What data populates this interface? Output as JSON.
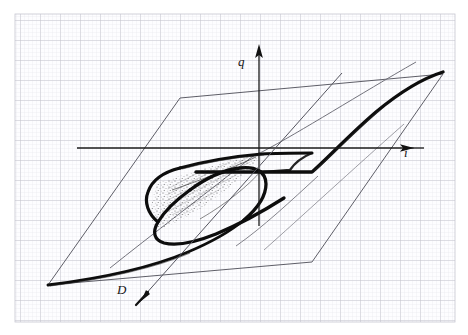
{
  "figure": {
    "medium": "pencil sketch on millimetre graph paper",
    "background_color": "#ffffff",
    "paper": {
      "x": 15,
      "y": 14,
      "width": 440,
      "height": 308,
      "fill": "#fefeff",
      "minor_grid_color": "#e3e3e8",
      "major_grid_color": "#b9b9c4",
      "minor_step": 4,
      "major_step": 20
    },
    "axes": [
      {
        "name": "vertical-axis",
        "label": "q",
        "label_position": {
          "x": 238,
          "y": 55
        },
        "from": {
          "x": 259,
          "y": 225
        },
        "to": {
          "x": 259,
          "y": 45
        },
        "arrow": "up",
        "color": "#1a1a1a"
      },
      {
        "name": "horizontal-axis",
        "label": "i",
        "label_position": {
          "x": 404,
          "y": 146
        },
        "from": {
          "x": 77,
          "y": 148
        },
        "to": {
          "x": 424,
          "y": 148
        },
        "arrow": "right",
        "color": "#1a1a1a"
      },
      {
        "name": "depth-axis",
        "label": "D",
        "label_position": {
          "x": 117,
          "y": 283
        },
        "from": {
          "x": 340,
          "y": 75
        },
        "to": {
          "x": 140,
          "y": 300
        },
        "arrow": "down-left",
        "color": "#1a1a1a"
      }
    ],
    "parallelogram": {
      "name": "base-plane-outline",
      "points": [
        {
          "x": 180,
          "y": 98
        },
        {
          "x": 443,
          "y": 74
        },
        {
          "x": 312,
          "y": 262
        },
        {
          "x": 48,
          "y": 285
        }
      ],
      "stroke": "#4a4a55",
      "stroke_width": 0.9
    },
    "curves": [
      {
        "name": "fold-surface-bold-edge",
        "description": "thick S-shaped fold edge of the catastrophe surface running from lower-left, through the double fold, up to the far right",
        "stroke": "#0d0d0d",
        "stroke_width": 3.4
      },
      {
        "name": "upper-sheet-edge",
        "description": "thin curve forming the upper sheet boundary through the cusp point",
        "stroke": "#2a2a2a",
        "stroke_width": 1.1
      },
      {
        "name": "shaded-fold-region",
        "description": "hatched / stippled shading between the two fold lines",
        "stroke": "#1a1a1a"
      }
    ],
    "key_points": {
      "cusp_point": {
        "x": 259,
        "y": 152
      },
      "fold_nose_left": {
        "x": 156,
        "y": 205
      },
      "fold_crossing": {
        "x": 198,
        "y": 222
      },
      "plateau_kink": {
        "x": 312,
        "y": 172
      },
      "lower_left_tail": {
        "x": 48,
        "y": 285
      }
    }
  }
}
